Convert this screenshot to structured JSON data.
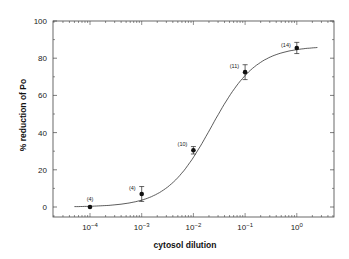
{
  "chart_data": {
    "type": "scatter",
    "title": "",
    "xlabel": "cytosol dilution",
    "ylabel": "% reduction of Po",
    "xscale": "log",
    "xlim": [
      2e-05,
      4
    ],
    "ylim": [
      -5,
      100
    ],
    "x_ticks": [
      0.0001,
      0.001,
      0.01,
      0.1,
      1
    ],
    "x_tick_labels": [
      {
        "base": "10",
        "exp": "−4"
      },
      {
        "base": "10",
        "exp": "−3"
      },
      {
        "base": "10",
        "exp": "−2"
      },
      {
        "base": "10",
        "exp": "−1"
      },
      {
        "base": "10",
        "exp": "0"
      }
    ],
    "y_ticks": [
      0,
      20,
      40,
      60,
      80,
      100
    ],
    "grid": false,
    "legend": null,
    "series": [
      {
        "name": "measured",
        "marker": "filled-circle",
        "points": [
          {
            "x": 0.0001,
            "y": 0,
            "err": 0.5,
            "n_label": "(4)"
          },
          {
            "x": 0.001,
            "y": 7,
            "err": 4,
            "n_label": "(4)"
          },
          {
            "x": 0.01,
            "y": 30.5,
            "err": 2,
            "n_label": "(10)"
          },
          {
            "x": 0.1,
            "y": 72.5,
            "err": 4,
            "n_label": "(11)"
          },
          {
            "x": 1,
            "y": 85.5,
            "err": 3,
            "n_label": "(14)"
          }
        ]
      },
      {
        "name": "fit",
        "type": "line",
        "model": "sigmoid",
        "bottom": 0,
        "top": 86.5,
        "log_ec50": -1.65,
        "hill": 1.0,
        "x_range": [
          5e-05,
          2.5
        ]
      }
    ]
  },
  "axes": {
    "xlabel": "cytosol dilution",
    "ylabel": "% reduction of Po"
  }
}
